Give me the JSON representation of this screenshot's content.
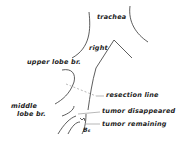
{
  "diagram": {
    "labels": {
      "trachea": "trachea",
      "right": "right",
      "upper_lobe": "upper lobe br.",
      "resection_line": "resection line",
      "middle_1": "middle",
      "middle_2": "lobe br.",
      "tumor_disappeared": "tumor disappeared",
      "tumor_remaining": "tumor remaining",
      "b6": "B₆"
    },
    "colors": {
      "line": "#333333",
      "dash": "#999999"
    }
  }
}
